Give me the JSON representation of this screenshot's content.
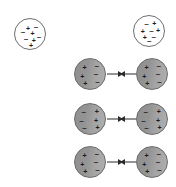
{
  "figure": {
    "type": "physics-diagram",
    "title": "",
    "background_color": "#ffffff",
    "width": 176,
    "height": 187,
    "symbols": {
      "positive": "+",
      "negative": "–"
    },
    "colors": {
      "neutral_fill": "#ffffff",
      "neutral_stroke": "#6f6f6f",
      "polar_fill_dark": "#8f8f8f",
      "polar_fill_light": "#b0b0b0",
      "polar_stroke": "#6a6a6a",
      "charge_color": "#1a1a1a",
      "arrow_color": "#2b2b2b"
    }
  },
  "groups": [
    {
      "name": "nonpolar-row",
      "label": "",
      "atoms": [
        {
          "name": "nonpolar-atom-left",
          "style": "neutral",
          "cx": 30,
          "cy": 34,
          "r": 16,
          "charges": [
            {
              "sign": "+",
              "x": 36,
              "y": 24
            },
            {
              "sign": "–",
              "x": 58,
              "y": 22
            },
            {
              "sign": "–",
              "x": 22,
              "y": 36
            },
            {
              "sign": "+",
              "x": 48,
              "y": 38
            },
            {
              "sign": "–",
              "x": 30,
              "y": 56
            },
            {
              "sign": "+",
              "x": 52,
              "y": 58
            },
            {
              "sign": "+",
              "x": 44,
              "y": 72
            },
            {
              "sign": "–",
              "x": 66,
              "y": 50
            }
          ]
        },
        {
          "name": "nonpolar-atom-right",
          "style": "neutral",
          "cx": 149,
          "cy": 31,
          "r": 16,
          "charges": [
            {
              "sign": "–",
              "x": 34,
              "y": 22
            },
            {
              "sign": "+",
              "x": 56,
              "y": 20
            },
            {
              "sign": "+",
              "x": 24,
              "y": 40
            },
            {
              "sign": "–",
              "x": 48,
              "y": 42
            },
            {
              "sign": "+",
              "x": 30,
              "y": 58
            },
            {
              "sign": "–",
              "x": 54,
              "y": 58
            },
            {
              "sign": "+",
              "x": 66,
              "y": 38
            },
            {
              "sign": "–",
              "x": 42,
              "y": 70
            }
          ]
        }
      ]
    },
    {
      "name": "polar-pair-row-1",
      "label": "",
      "polarity": "plus-left",
      "atoms": [
        {
          "name": "polar-atom-row1-left",
          "style": "polar",
          "cx": 90,
          "cy": 74,
          "r": 16,
          "charges": [
            {
              "sign": "+",
              "x": 26,
              "y": 22
            },
            {
              "sign": "–",
              "x": 60,
              "y": 20
            },
            {
              "sign": "+",
              "x": 20,
              "y": 46
            },
            {
              "sign": "–",
              "x": 58,
              "y": 42
            },
            {
              "sign": "+",
              "x": 28,
              "y": 66
            },
            {
              "sign": "–",
              "x": 62,
              "y": 62
            }
          ]
        },
        {
          "name": "polar-atom-row1-right",
          "style": "polar",
          "cx": 152,
          "cy": 74,
          "r": 16,
          "charges": [
            {
              "sign": "+",
              "x": 26,
              "y": 22
            },
            {
              "sign": "–",
              "x": 60,
              "y": 20
            },
            {
              "sign": "+",
              "x": 20,
              "y": 46
            },
            {
              "sign": "–",
              "x": 58,
              "y": 42
            },
            {
              "sign": "+",
              "x": 28,
              "y": 66
            },
            {
              "sign": "–",
              "x": 62,
              "y": 62
            }
          ]
        }
      ],
      "arrows": [
        {
          "name": "attraction-arrow-row1-right",
          "direction": "right",
          "x": 107,
          "y": 74,
          "length": 16
        },
        {
          "name": "attraction-arrow-row1-left",
          "direction": "left",
          "x": 120,
          "y": 74,
          "length": 16
        }
      ]
    },
    {
      "name": "polar-pair-row-2",
      "label": "",
      "polarity": "minus-left",
      "atoms": [
        {
          "name": "polar-atom-row2-left",
          "style": "polar",
          "cx": 90,
          "cy": 119,
          "r": 16,
          "charges": [
            {
              "sign": "–",
              "x": 24,
              "y": 22
            },
            {
              "sign": "+",
              "x": 60,
              "y": 20
            },
            {
              "sign": "–",
              "x": 18,
              "y": 46
            },
            {
              "sign": "+",
              "x": 58,
              "y": 44
            },
            {
              "sign": "–",
              "x": 26,
              "y": 66
            },
            {
              "sign": "+",
              "x": 62,
              "y": 64
            }
          ]
        },
        {
          "name": "polar-atom-row2-right",
          "style": "polar",
          "cx": 152,
          "cy": 119,
          "r": 16,
          "charges": [
            {
              "sign": "–",
              "x": 24,
              "y": 22
            },
            {
              "sign": "+",
              "x": 60,
              "y": 20
            },
            {
              "sign": "–",
              "x": 18,
              "y": 46
            },
            {
              "sign": "+",
              "x": 58,
              "y": 44
            },
            {
              "sign": "–",
              "x": 26,
              "y": 66
            },
            {
              "sign": "+",
              "x": 62,
              "y": 64
            }
          ]
        }
      ],
      "arrows": [
        {
          "name": "attraction-arrow-row2-right",
          "direction": "right",
          "x": 107,
          "y": 119,
          "length": 16
        },
        {
          "name": "attraction-arrow-row2-left",
          "direction": "left",
          "x": 120,
          "y": 119,
          "length": 16
        }
      ]
    },
    {
      "name": "polar-pair-row-3",
      "label": "",
      "polarity": "plus-left",
      "atoms": [
        {
          "name": "polar-atom-row3-left",
          "style": "polar",
          "cx": 90,
          "cy": 162,
          "r": 16,
          "charges": [
            {
              "sign": "+",
              "x": 26,
              "y": 22
            },
            {
              "sign": "–",
              "x": 60,
              "y": 20
            },
            {
              "sign": "+",
              "x": 20,
              "y": 46
            },
            {
              "sign": "–",
              "x": 58,
              "y": 42
            },
            {
              "sign": "+",
              "x": 28,
              "y": 66
            },
            {
              "sign": "–",
              "x": 62,
              "y": 62
            }
          ]
        },
        {
          "name": "polar-atom-row3-right",
          "style": "polar",
          "cx": 152,
          "cy": 162,
          "r": 16,
          "charges": [
            {
              "sign": "+",
              "x": 26,
              "y": 22
            },
            {
              "sign": "–",
              "x": 60,
              "y": 20
            },
            {
              "sign": "+",
              "x": 20,
              "y": 46
            },
            {
              "sign": "–",
              "x": 58,
              "y": 42
            },
            {
              "sign": "+",
              "x": 28,
              "y": 66
            },
            {
              "sign": "–",
              "x": 62,
              "y": 62
            }
          ]
        }
      ],
      "arrows": [
        {
          "name": "attraction-arrow-row3-right",
          "direction": "right",
          "x": 107,
          "y": 162,
          "length": 16
        },
        {
          "name": "attraction-arrow-row3-left",
          "direction": "left",
          "x": 120,
          "y": 162,
          "length": 16
        }
      ]
    }
  ]
}
